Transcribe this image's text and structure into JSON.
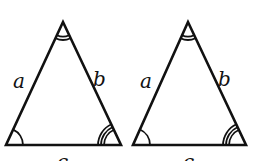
{
  "diagram": {
    "type": "congruent-isosceles-triangles",
    "stroke_color": "#111111",
    "background": "#ffffff",
    "triangles": [
      {
        "id": "left",
        "labels": {
          "left_side": "a",
          "right_side": "b",
          "base": "c"
        },
        "angle_marks": {
          "apex": "double-arc",
          "bottom_left": "single-arc",
          "bottom_right": "triple-arc"
        }
      },
      {
        "id": "right",
        "labels": {
          "left_side": "a",
          "right_side": "b",
          "base": "c"
        },
        "angle_marks": {
          "apex": "double-arc",
          "bottom_left": "single-arc",
          "bottom_right": "triple-arc"
        }
      }
    ]
  }
}
